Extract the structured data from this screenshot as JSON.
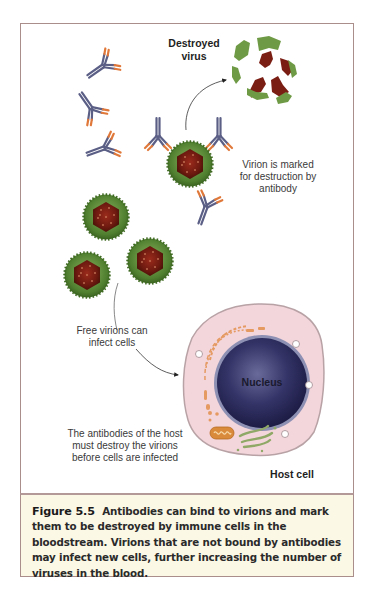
{
  "figure": {
    "labels": {
      "destroyed_virus": [
        "Destroyed",
        "virus"
      ],
      "virion_marked": [
        "Virion is marked",
        "for destruction by",
        "antibody"
      ],
      "free_virions": [
        "Free virions can",
        "infect cells"
      ],
      "antibodies_host": [
        "The antibodies of the host",
        "must destroy the virions",
        "before cells are infected"
      ],
      "nucleus": "Nucleus",
      "host_cell": "Host cell"
    },
    "elements": {
      "free_antibodies": 3,
      "bound_antibodies": 3,
      "free_virions": 3,
      "marked_virions": 1,
      "destroyed_virus_fragments": 7,
      "cell_vacuoles": 4
    },
    "colors": {
      "frame_border": "#a98e8c",
      "caption_bg": "#fbf8e6",
      "antibody_stem": "#5b5f86",
      "antibody_tip": "#e0783a",
      "virion_shell": "#5d8a3c",
      "virion_core": "#7a1e14",
      "cell_cytoplasm": "#f3d6dc",
      "cell_membrane": "#b8a2a6",
      "nucleus": "#2c2b5c",
      "nuclear_envelope": "#8d8fb3",
      "er": "#e59a62",
      "golgi": "#8fa866",
      "mitochondrion": "#d98a3a"
    }
  },
  "caption": {
    "figure_number": "Figure 5.5",
    "text": "Antibodies can bind to virions and mark them to be destroyed by immune cells in the bloodstream. Virions that are not bound by antibodies may infect new cells, further increasing the number of viruses in the blood."
  },
  "trailing_text": "..."
}
